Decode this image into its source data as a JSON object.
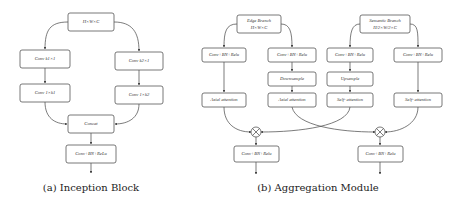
{
  "inception_block": {
    "caption": "(a) Inception Block",
    "input": "H×W×C",
    "branch_left": [
      "Conv k1×1",
      "Conv 1×k1"
    ],
    "branch_right": [
      "Conv k2×1",
      "Conv 1×k2"
    ],
    "merge": "Concat",
    "output": "Conv+BN+ReLu"
  },
  "aggregation_module": {
    "caption": "(b) Aggregation Module",
    "edge_branch": {
      "line1": "Edge Branch",
      "line2": "H×W×C"
    },
    "semantic_branch": {
      "line1": "Semantic Branch",
      "line2": "H/2×W/2×C"
    },
    "row1": [
      "Conv+BN+Relu",
      "Conv+BN+Relu",
      "Conv+BN+Relu",
      "Conv+BN+Relu"
    ],
    "row2": [
      "Downsample",
      "Upsample"
    ],
    "row3": [
      "Axial attention",
      "Axial attention",
      "Self- attention",
      "Self- attention"
    ],
    "multiply_symbol": "⊗",
    "outputs": [
      "Conv+BN+Relu",
      "Conv+BN+Relu"
    ]
  }
}
